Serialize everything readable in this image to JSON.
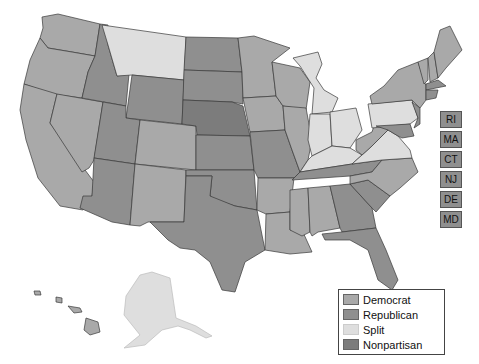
{
  "legend": {
    "items": [
      {
        "label": "Democrat",
        "class": "dem",
        "color": "#a9a9a9"
      },
      {
        "label": "Republican",
        "class": "rep",
        "color": "#8f8f8f"
      },
      {
        "label": "Split",
        "class": "split",
        "color": "#dedede"
      },
      {
        "label": "Nonpartisan",
        "class": "np",
        "color": "#7c7c7c"
      }
    ]
  },
  "small_states": [
    {
      "abbr": "RI",
      "party": "Republican"
    },
    {
      "abbr": "MA",
      "party": "Republican"
    },
    {
      "abbr": "CT",
      "party": "Republican"
    },
    {
      "abbr": "NJ",
      "party": "Republican"
    },
    {
      "abbr": "DE",
      "party": "Republican"
    },
    {
      "abbr": "MD",
      "party": "Republican"
    }
  ],
  "states": {
    "WA": "Democrat",
    "OR": "Democrat",
    "CA": "Democrat",
    "NV": "Democrat",
    "ID": "Republican",
    "MT": "Split",
    "WY": "Republican",
    "UT": "Republican",
    "AZ": "Republican",
    "CO": "Democrat",
    "NM": "Democrat",
    "ND": "Republican",
    "SD": "Republican",
    "NE": "Nonpartisan",
    "KS": "Republican",
    "OK": "Republican",
    "TX": "Republican",
    "MN": "Democrat",
    "IA": "Democrat",
    "MO": "Republican",
    "AR": "Democrat",
    "LA": "Democrat",
    "WI": "Democrat",
    "IL": "Democrat",
    "MI": "Split",
    "IN": "Split",
    "OH": "Split",
    "KY": "Split",
    "TN": "Republican",
    "MS": "Democrat",
    "AL": "Democrat",
    "GA": "Republican",
    "FL": "Republican",
    "SC": "Republican",
    "NC": "Democrat",
    "VA": "Split",
    "WV": "Democrat",
    "PA": "Split",
    "NY": "Democrat",
    "VT": "Democrat",
    "NH": "Democrat",
    "ME": "Democrat",
    "AK": "Split",
    "HI": "Democrat"
  }
}
